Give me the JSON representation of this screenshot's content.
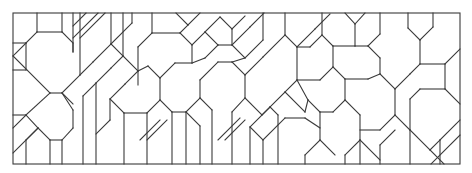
{
  "diagram": {
    "type": "geometric-tiling-line-drawing",
    "canvas": {
      "width": 472,
      "height": 173,
      "background": "#ffffff"
    },
    "stroke": {
      "color": "#3a3a3a",
      "width": 1.1
    },
    "frame": {
      "x": 13,
      "y": 13,
      "width": 447,
      "height": 151
    },
    "segments": [
      [
        13,
        43,
        26,
        43
      ],
      [
        26,
        43,
        26,
        70
      ],
      [
        13,
        70,
        26,
        70
      ],
      [
        26,
        43,
        37,
        32
      ],
      [
        37,
        32,
        37,
        13
      ],
      [
        37,
        32,
        62,
        32
      ],
      [
        62,
        32,
        62,
        13
      ],
      [
        62,
        32,
        73,
        43
      ],
      [
        73,
        43,
        73,
        52
      ],
      [
        26,
        43,
        13,
        56
      ],
      [
        13,
        56,
        50,
        93
      ],
      [
        50,
        93,
        62,
        93
      ],
      [
        62,
        93,
        80,
        75
      ],
      [
        13,
        115,
        26,
        115
      ],
      [
        26,
        115,
        50,
        93
      ],
      [
        26,
        115,
        13,
        128
      ],
      [
        26,
        115,
        38,
        128
      ],
      [
        38,
        128,
        50,
        140
      ],
      [
        50,
        140,
        62,
        140
      ],
      [
        62,
        140,
        73,
        128
      ],
      [
        73,
        128,
        73,
        110
      ],
      [
        73,
        110,
        62,
        93
      ],
      [
        38,
        128,
        13,
        153
      ],
      [
        38,
        128,
        26,
        140
      ],
      [
        26,
        140,
        26,
        164
      ],
      [
        50,
        140,
        50,
        164
      ],
      [
        62,
        140,
        62,
        164
      ],
      [
        73,
        13,
        73,
        52
      ],
      [
        80,
        13,
        80,
        75
      ],
      [
        80,
        75,
        93,
        62
      ],
      [
        93,
        62,
        111,
        44
      ],
      [
        111,
        44,
        111,
        13
      ],
      [
        98,
        13,
        73,
        38
      ],
      [
        105,
        13,
        80,
        38
      ],
      [
        86,
        13,
        73,
        26
      ],
      [
        111,
        44,
        132,
        23
      ],
      [
        132,
        23,
        132,
        13
      ],
      [
        111,
        44,
        123,
        56
      ],
      [
        123,
        56,
        123,
        13
      ],
      [
        123,
        56,
        111,
        68
      ],
      [
        111,
        68,
        96,
        83
      ],
      [
        96,
        83,
        96,
        164
      ],
      [
        96,
        83,
        83,
        96
      ],
      [
        83,
        96,
        83,
        164
      ],
      [
        123,
        56,
        138,
        71
      ],
      [
        138,
        71,
        138,
        47
      ],
      [
        138,
        47,
        152,
        33
      ],
      [
        152,
        33,
        180,
        33
      ],
      [
        180,
        33,
        188,
        25
      ],
      [
        138,
        71,
        125,
        84
      ],
      [
        125,
        84,
        110,
        99
      ],
      [
        110,
        99,
        110,
        120
      ],
      [
        110,
        99,
        124,
        113
      ],
      [
        124,
        113,
        124,
        164
      ],
      [
        110,
        120,
        96,
        134
      ],
      [
        124,
        113,
        147,
        113
      ],
      [
        147,
        113,
        160,
        100
      ],
      [
        160,
        100,
        160,
        78
      ],
      [
        160,
        78,
        148,
        66
      ],
      [
        148,
        66,
        138,
        71
      ],
      [
        160,
        78,
        175,
        63
      ],
      [
        175,
        63,
        192,
        63
      ],
      [
        152,
        33,
        152,
        13
      ],
      [
        180,
        33,
        192,
        45
      ],
      [
        192,
        45,
        192,
        63
      ],
      [
        188,
        25,
        200,
        13
      ],
      [
        188,
        25,
        176,
        13
      ],
      [
        192,
        45,
        205,
        32
      ],
      [
        205,
        32,
        220,
        17
      ],
      [
        220,
        17,
        232,
        29
      ],
      [
        232,
        29,
        232,
        45
      ],
      [
        232,
        29,
        245,
        16
      ],
      [
        205,
        32,
        218,
        45
      ],
      [
        218,
        45,
        232,
        45
      ],
      [
        218,
        45,
        205,
        58
      ],
      [
        205,
        58,
        192,
        63
      ],
      [
        160,
        100,
        172,
        112
      ],
      [
        172,
        112,
        172,
        164
      ],
      [
        172,
        112,
        186,
        112
      ],
      [
        186,
        112,
        200,
        98
      ],
      [
        200,
        98,
        200,
        80
      ],
      [
        200,
        80,
        218,
        62
      ],
      [
        218,
        62,
        232,
        62
      ],
      [
        232,
        62,
        245,
        75
      ],
      [
        245,
        75,
        245,
        98
      ],
      [
        245,
        98,
        232,
        112
      ],
      [
        232,
        112,
        232,
        164
      ],
      [
        200,
        98,
        212,
        110
      ],
      [
        212,
        110,
        212,
        164
      ],
      [
        186,
        112,
        200,
        126
      ],
      [
        200,
        126,
        200,
        164
      ],
      [
        232,
        45,
        245,
        58
      ],
      [
        245,
        58,
        263,
        40
      ],
      [
        263,
        40,
        263,
        13
      ],
      [
        245,
        58,
        232,
        62
      ],
      [
        232,
        45,
        250,
        27
      ],
      [
        250,
        27,
        264,
        13
      ],
      [
        245,
        75,
        263,
        57
      ],
      [
        263,
        57,
        285,
        35
      ],
      [
        285,
        35,
        285,
        13
      ],
      [
        285,
        35,
        297,
        47
      ],
      [
        297,
        47,
        297,
        80
      ],
      [
        297,
        80,
        285,
        92
      ],
      [
        285,
        92,
        270,
        107
      ],
      [
        270,
        107,
        250,
        127
      ],
      [
        250,
        127,
        250,
        164
      ],
      [
        250,
        127,
        263,
        140
      ],
      [
        263,
        140,
        263,
        164
      ],
      [
        270,
        107,
        278,
        115
      ],
      [
        278,
        115,
        278,
        164
      ],
      [
        245,
        98,
        262,
        115
      ],
      [
        262,
        115,
        270,
        107
      ],
      [
        297,
        47,
        315,
        29
      ],
      [
        315,
        29,
        330,
        14
      ],
      [
        297,
        47,
        310,
        47
      ],
      [
        310,
        47,
        322,
        35
      ],
      [
        322,
        35,
        322,
        13
      ],
      [
        297,
        80,
        320,
        80
      ],
      [
        320,
        80,
        333,
        67
      ],
      [
        333,
        67,
        333,
        46
      ],
      [
        333,
        46,
        322,
        35
      ],
      [
        333,
        67,
        345,
        79
      ],
      [
        345,
        79,
        345,
        100
      ],
      [
        345,
        100,
        333,
        112
      ],
      [
        333,
        112,
        320,
        112
      ],
      [
        320,
        112,
        308,
        100
      ],
      [
        308,
        100,
        297,
        80
      ],
      [
        320,
        112,
        320,
        140
      ],
      [
        320,
        140,
        305,
        155
      ],
      [
        305,
        155,
        305,
        164
      ],
      [
        345,
        100,
        360,
        115
      ],
      [
        360,
        115,
        360,
        140
      ],
      [
        360,
        140,
        345,
        155
      ],
      [
        345,
        155,
        345,
        164
      ],
      [
        333,
        46,
        355,
        46
      ],
      [
        355,
        46,
        355,
        24
      ],
      [
        355,
        24,
        345,
        13
      ],
      [
        355,
        24,
        365,
        13
      ],
      [
        355,
        46,
        368,
        46
      ],
      [
        368,
        46,
        380,
        34
      ],
      [
        380,
        34,
        380,
        13
      ],
      [
        368,
        46,
        380,
        58
      ],
      [
        380,
        58,
        380,
        74
      ],
      [
        345,
        79,
        368,
        79
      ],
      [
        368,
        79,
        380,
        74
      ],
      [
        380,
        74,
        395,
        89
      ],
      [
        395,
        89,
        395,
        115
      ],
      [
        395,
        115,
        380,
        130
      ],
      [
        380,
        130,
        360,
        130
      ],
      [
        395,
        89,
        410,
        74
      ],
      [
        410,
        74,
        420,
        64
      ],
      [
        420,
        64,
        420,
        40
      ],
      [
        420,
        40,
        433,
        27
      ],
      [
        433,
        27,
        433,
        13
      ],
      [
        420,
        40,
        408,
        28
      ],
      [
        408,
        28,
        408,
        13
      ],
      [
        420,
        64,
        445,
        64
      ],
      [
        445,
        64,
        460,
        49
      ],
      [
        445,
        64,
        445,
        89
      ],
      [
        445,
        89,
        460,
        104
      ],
      [
        445,
        89,
        420,
        89
      ],
      [
        420,
        89,
        410,
        99
      ],
      [
        410,
        99,
        410,
        130
      ],
      [
        410,
        130,
        395,
        115
      ],
      [
        410,
        130,
        430,
        150
      ],
      [
        430,
        150,
        444,
        164
      ],
      [
        410,
        130,
        410,
        164
      ],
      [
        395,
        130,
        380,
        145
      ],
      [
        380,
        145,
        380,
        164
      ],
      [
        430,
        150,
        440,
        140
      ],
      [
        440,
        140,
        460,
        120
      ],
      [
        440,
        140,
        440,
        164
      ],
      [
        460,
        135,
        431,
        164
      ],
      [
        360,
        140,
        380,
        160
      ],
      [
        360,
        140,
        360,
        164
      ],
      [
        320,
        140,
        335,
        155
      ],
      [
        285,
        92,
        305,
        112
      ],
      [
        305,
        112,
        308,
        100
      ],
      [
        263,
        140,
        285,
        118
      ],
      [
        285,
        118,
        305,
        118
      ],
      [
        305,
        118,
        320,
        128
      ],
      [
        225,
        140,
        245,
        120
      ],
      [
        218,
        140,
        240,
        118
      ],
      [
        140,
        140,
        160,
        120
      ],
      [
        147,
        140,
        167,
        120
      ],
      [
        138,
        71,
        138,
        85
      ],
      [
        62,
        93,
        73,
        104
      ],
      [
        147,
        113,
        147,
        164
      ],
      [
        186,
        112,
        186,
        164
      ]
    ]
  }
}
